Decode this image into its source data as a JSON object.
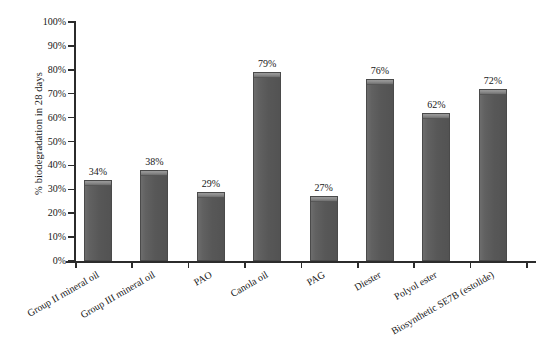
{
  "chart_data": {
    "type": "bar",
    "title": "",
    "xlabel": "",
    "ylabel": "% biodegradation in 28 days",
    "ylim": [
      0,
      100
    ],
    "grid": false,
    "legend": "none",
    "categories": [
      "Group II mineral oil",
      "Group III mineral oil",
      "PAO",
      "Canola oil",
      "PAG",
      "Diester",
      "Polyol ester",
      "Biosynthetic SE7B (estolide)"
    ],
    "values": [
      34,
      38,
      29,
      79,
      27,
      76,
      62,
      72
    ],
    "value_labels": [
      "34%",
      "38%",
      "29%",
      "79%",
      "27%",
      "76%",
      "62%",
      "72%"
    ],
    "ytick_labels": [
      "0%",
      "10%",
      "20%",
      "30%",
      "40%",
      "50%",
      "60%",
      "70%",
      "80%",
      "90%",
      "100%"
    ],
    "ytick_values": [
      0,
      10,
      20,
      30,
      40,
      50,
      60,
      70,
      80,
      90,
      100
    ],
    "bar_color": "#5c5c5c",
    "bar_edge_color": "#4a4a4a",
    "bar_cap_color": "#8d8d8d",
    "axis_color": "#2b2b2b",
    "background_color": "#ffffff"
  }
}
